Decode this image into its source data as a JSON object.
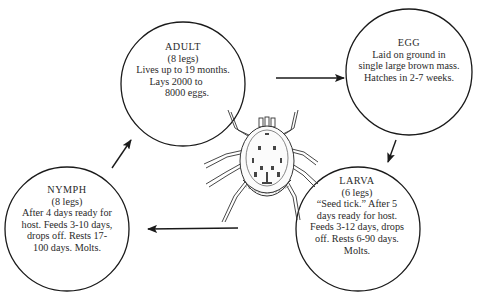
{
  "diagram": {
    "type": "life-cycle",
    "subject": "tick",
    "stages": [
      {
        "id": "adult",
        "title": "ADULT",
        "legs": "(8 legs)",
        "lines": [
          "Lives up to 19 months.",
          "Lays 2000  to",
          "8000 eggs."
        ]
      },
      {
        "id": "egg",
        "title": "EGG",
        "legs": "",
        "lines": [
          "Laid on ground in",
          "single large brown mass.",
          "Hatches in 2-7 weeks."
        ]
      },
      {
        "id": "larva",
        "title": "LARVA",
        "legs": "(6 legs)",
        "lines": [
          "“Seed tick.” After 5",
          "days ready for host.",
          "Feeds 3-12 days, drops",
          "off. Rests 6-90 days.",
          "Molts."
        ]
      },
      {
        "id": "nymph",
        "title": "NYMPH",
        "legs": "(8 legs)",
        "lines": [
          "After 4 days ready for",
          "host. Feeds 3-10 days,",
          "drops off. Rests 17-",
          "100 days. Molts."
        ]
      }
    ],
    "arrows": [
      {
        "from": "adult",
        "to": "egg"
      },
      {
        "from": "egg",
        "to": "larva"
      },
      {
        "from": "larva",
        "to": "nymph"
      },
      {
        "from": "nymph",
        "to": "adult"
      }
    ],
    "center_illustration": "tick-illustration",
    "colors": {
      "line": "#1a1a1a",
      "text": "#2a2a2a",
      "background": "#ffffff"
    }
  }
}
